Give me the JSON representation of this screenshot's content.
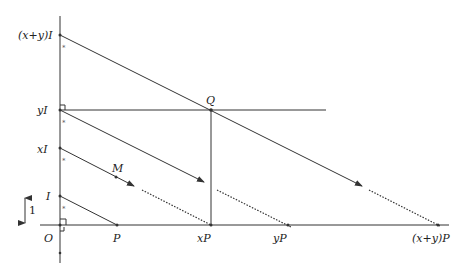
{
  "diagram": {
    "labels": {
      "x_plus_y_I": "(x+y)I",
      "yI": "yI",
      "xI": "xI",
      "I": "I",
      "O": "O",
      "P": "P",
      "xP": "xP",
      "yP": "yP",
      "x_plus_y_P": "(x+y)P",
      "Q": "Q",
      "M": "M",
      "unit": "1"
    },
    "angle_marks": [
      "*",
      "*",
      "*",
      "*"
    ],
    "colors": {
      "stroke": "#333333",
      "background": "#ffffff"
    }
  }
}
